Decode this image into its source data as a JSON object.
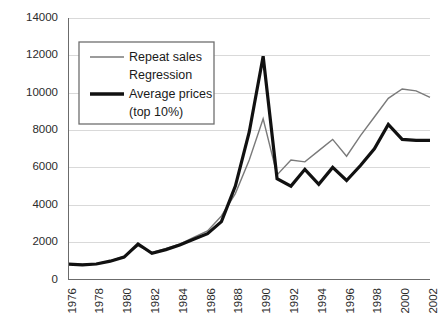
{
  "chart_data": {
    "type": "line",
    "title": "",
    "subtitle": "",
    "xlabel": "",
    "ylabel": "",
    "xlim": [
      1976,
      2002
    ],
    "ylim": [
      0,
      14000
    ],
    "grid": true,
    "legend_position": "top-left",
    "y_ticks": [
      "0",
      "2000",
      "4000",
      "6000",
      "8000",
      "10000",
      "12000",
      "14000"
    ],
    "y_tick_values": [
      0,
      2000,
      4000,
      6000,
      8000,
      10000,
      12000,
      14000
    ],
    "x_ticks": [
      "1976",
      "1978",
      "1980",
      "1982",
      "1984",
      "1986",
      "1988",
      "1990",
      "1992",
      "1994",
      "1996",
      "1998",
      "2000",
      "2002"
    ],
    "x_tick_values": [
      1976,
      1978,
      1980,
      1982,
      1984,
      1986,
      1988,
      1990,
      1992,
      1994,
      1996,
      1998,
      2000,
      2002
    ],
    "x": [
      1976,
      1977,
      1978,
      1979,
      1980,
      1981,
      1982,
      1983,
      1984,
      1985,
      1986,
      1987,
      1988,
      1989,
      1990,
      1991,
      1992,
      1993,
      1994,
      1995,
      1996,
      1997,
      1998,
      1999,
      2000,
      2001,
      2002
    ],
    "series": [
      {
        "name": "Repeat sales Regression",
        "color": "#7a7a7a",
        "line_width": 1.4,
        "values": [
          850,
          800,
          850,
          1000,
          1250,
          1800,
          1450,
          1650,
          1900,
          2250,
          2600,
          3400,
          4600,
          6400,
          8600,
          5600,
          6400,
          6300,
          6900,
          7500,
          6600,
          7700,
          8700,
          9700,
          10200,
          10100,
          9750
        ]
      },
      {
        "name": "Average prices (top 10%)",
        "color": "#111111",
        "line_width": 3.2,
        "values": [
          820,
          780,
          830,
          980,
          1200,
          1900,
          1400,
          1600,
          1850,
          2150,
          2450,
          3100,
          5000,
          7900,
          11950,
          5400,
          5000,
          5900,
          5100,
          6000,
          5300,
          6100,
          7000,
          8300,
          7500,
          7450,
          7450
        ]
      }
    ]
  },
  "legend": {
    "entries": [
      {
        "label_line1": "Repeat sales",
        "label_line2": "Regression",
        "swatch": "thin-gray-line"
      },
      {
        "label_line1": "Average prices",
        "label_line2": "(top 10%)",
        "swatch": "thick-black-line"
      }
    ]
  },
  "colors": {
    "series_repeat_sales": "#7a7a7a",
    "series_average_prices": "#111111",
    "gridline": "#d9d9d9",
    "axis": "#6b6b6b",
    "background": "#ffffff",
    "text": "#1a1a1a"
  }
}
